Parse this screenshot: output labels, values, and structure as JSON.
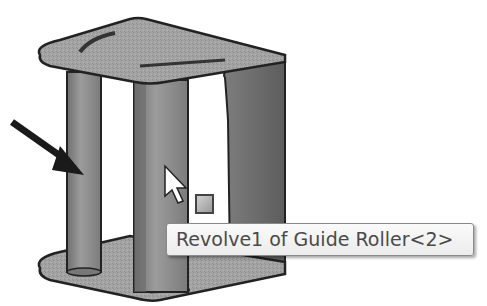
{
  "viewport": {
    "model": "Guide Roller assembly",
    "background": "#ffffff",
    "part_color": "#9a9a9a",
    "edge_color": "#2a2a2a"
  },
  "annotations": {
    "callout_arrow": "arrow-pointing-right-down"
  },
  "cursor": {
    "icon": "arrow-pointer-icon"
  },
  "selection_indicator": {
    "icon": "face-selection-icon"
  },
  "tooltip": {
    "text": "Revolve1 of Guide Roller<2>"
  }
}
